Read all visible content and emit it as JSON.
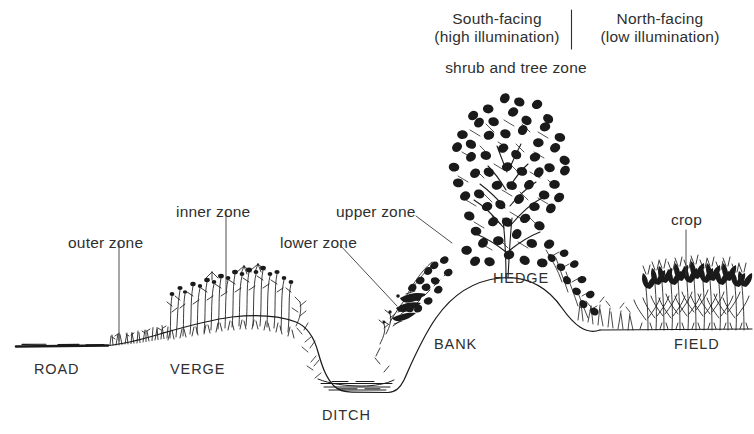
{
  "diagram": {
    "background_color": "#ffffff",
    "ink_color": "#1a1a1a",
    "text_color": "#2f2f2f"
  },
  "header": {
    "south": {
      "line1": "South-facing",
      "line2": "(high illumination)"
    },
    "north": {
      "line1": "North-facing",
      "line2": "(low illumination)"
    },
    "subtitle": "shrub and tree zone",
    "divider": "vertical-rule"
  },
  "zone_labels": [
    {
      "id": "outer-zone",
      "text": "outer zone",
      "x": 68,
      "y": 234,
      "leader": "vertical"
    },
    {
      "id": "inner-zone",
      "text": "inner zone",
      "x": 176,
      "y": 203,
      "leader": "vertical"
    },
    {
      "id": "upper-zone",
      "text": "upper zone",
      "x": 336,
      "y": 203,
      "leader": "diagonal"
    },
    {
      "id": "lower-zone",
      "text": "lower zone",
      "x": 280,
      "y": 236,
      "leader": "diagonal"
    },
    {
      "id": "crop",
      "text": "crop",
      "x": 671,
      "y": 220,
      "leader": "vertical"
    }
  ],
  "feature_labels": [
    {
      "id": "road",
      "text": "ROAD",
      "x": 34,
      "y": 362
    },
    {
      "id": "verge",
      "text": "VERGE",
      "x": 170,
      "y": 362
    },
    {
      "id": "ditch",
      "text": "DITCH",
      "x": 322,
      "y": 408
    },
    {
      "id": "bank",
      "text": "BANK",
      "x": 434,
      "y": 337
    },
    {
      "id": "hedge",
      "text": "HEDGE",
      "x": 493,
      "y": 271
    },
    {
      "id": "field",
      "text": "FIELD",
      "x": 674,
      "y": 337
    }
  ],
  "terrain": {
    "road_surface": {
      "x1": 16,
      "x2": 108,
      "y": 346
    },
    "verge_mound_peak": {
      "x": 210,
      "y": 315
    },
    "ditch_bottom": {
      "x": 345,
      "y": 392
    },
    "ditch_water": true,
    "bank_crest": {
      "x": 505,
      "y": 278
    },
    "field_level": {
      "x1": 600,
      "x2": 752,
      "y": 330
    }
  }
}
